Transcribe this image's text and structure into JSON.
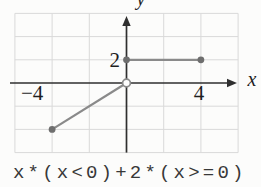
{
  "caption": {
    "text": "x*(x<0)+2*(x>=0)"
  },
  "colors": {
    "background": "#fcfcfb",
    "grid": "#d9d9d9",
    "axis": "#2f2f2f",
    "data_line": "#8a8a8a",
    "closed_dot": "#6e6e6e",
    "open_dot_fill": "#fdfdfd",
    "open_dot_stroke": "#8a8a8a",
    "label": "#1f1f1f",
    "caption_text": "#383838"
  },
  "chart_data": {
    "type": "line",
    "title": "",
    "subtitle": "",
    "xlabel": "x",
    "ylabel": "y",
    "xlim": [
      -6,
      6
    ],
    "ylim": [
      -6,
      6
    ],
    "grid": true,
    "grid_step": 2,
    "legend": "none",
    "x_tick_labels": [
      {
        "value": -4,
        "label": "−4"
      },
      {
        "value": 4,
        "label": "4"
      }
    ],
    "y_tick_labels": [
      {
        "value": 2,
        "label": "2"
      }
    ],
    "series": [
      {
        "name": "y = x for x < 0",
        "points": [
          [
            -4,
            -4
          ],
          [
            0,
            0
          ]
        ],
        "endpoints": [
          {
            "x": -4,
            "y": -4,
            "style": "closed"
          },
          {
            "x": 0,
            "y": 0,
            "style": "open"
          }
        ]
      },
      {
        "name": "y = 2 for x >= 0",
        "points": [
          [
            0,
            2
          ],
          [
            4,
            2
          ]
        ],
        "endpoints": [
          {
            "x": 0,
            "y": 2,
            "style": "closed"
          },
          {
            "x": 4,
            "y": 2,
            "style": "closed"
          }
        ]
      }
    ],
    "expression": "x*(x<0)+2*(x>=0)"
  }
}
